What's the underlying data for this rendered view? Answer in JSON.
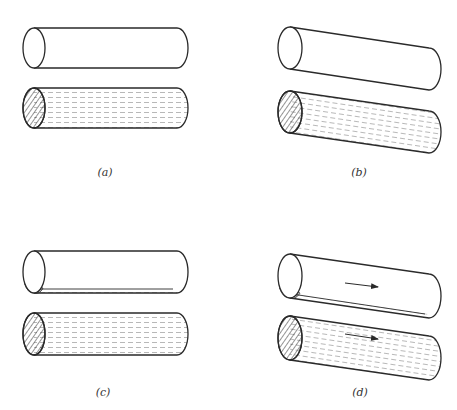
{
  "figure": {
    "type": "physics-illustration",
    "colors": {
      "stroke": "#2a2a2a",
      "fluid_dash": "#9a9a9a",
      "background": "#ffffff"
    },
    "panels": [
      {
        "id": "a",
        "label": "(a)",
        "orientation": "horizontal",
        "top_cylinder": {
          "state": "empty",
          "cx": 34,
          "cy": 48,
          "rx": 11,
          "ry": 20,
          "end_x": 177,
          "end_y": 48
        },
        "bottom_cylinder": {
          "state": "filled-with-fluid",
          "cx": 34,
          "cy": 108,
          "rx": 11,
          "ry": 20,
          "end_x": 177,
          "end_y": 108
        },
        "label_pos": {
          "x": 105,
          "y": 176
        }
      },
      {
        "id": "b",
        "label": "(b)",
        "orientation": "tilted",
        "top_cylinder": {
          "state": "empty",
          "cx": 290,
          "cy": 48,
          "rx": 12,
          "ry": 21,
          "end_x": 429,
          "end_y": 69
        },
        "bottom_cylinder": {
          "state": "filled-with-fluid",
          "cx": 290,
          "cy": 112,
          "rx": 12,
          "ry": 21,
          "end_x": 429,
          "end_y": 132
        },
        "label_pos": {
          "x": 359,
          "y": 176
        }
      },
      {
        "id": "c",
        "label": "(c)",
        "orientation": "horizontal",
        "top_cylinder": {
          "state": "thin-fluid-layer-at-bottom",
          "cx": 34,
          "cy": 272,
          "rx": 11,
          "ry": 21,
          "end_x": 177,
          "end_y": 272
        },
        "bottom_cylinder": {
          "state": "filled-with-fluid",
          "cx": 34,
          "cy": 334,
          "rx": 11,
          "ry": 21,
          "end_x": 177,
          "end_y": 334
        },
        "label_pos": {
          "x": 103,
          "y": 396
        }
      },
      {
        "id": "d",
        "label": "(d)",
        "orientation": "tilted",
        "top_cylinder": {
          "state": "thin-fluid-layer-flowing",
          "cx": 290,
          "cy": 276,
          "rx": 12,
          "ry": 22,
          "end_x": 429,
          "end_y": 296,
          "arrow": {
            "x1": 345,
            "y1": 283,
            "x2": 378,
            "y2": 287
          }
        },
        "bottom_cylinder": {
          "state": "filled-with-fluid-flowing",
          "cx": 290,
          "cy": 338,
          "rx": 12,
          "ry": 22,
          "end_x": 429,
          "end_y": 358,
          "arrow": {
            "x1": 345,
            "y1": 334,
            "x2": 378,
            "y2": 339
          }
        },
        "label_pos": {
          "x": 360,
          "y": 396
        }
      }
    ]
  }
}
